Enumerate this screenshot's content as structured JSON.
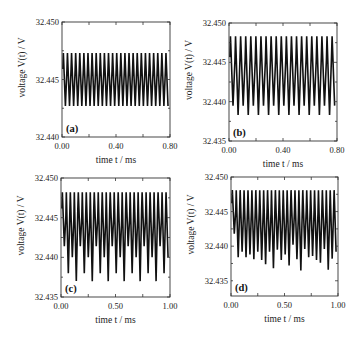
{
  "chart_data": [
    {
      "type": "line",
      "panel_label": "(a)",
      "title": "",
      "xlabel": "time t / ms",
      "ylabel": "voltage V(t) / V",
      "xlim": [
        0.0,
        0.8
      ],
      "ylim": [
        32.44,
        32.45
      ],
      "xticks": [
        "0.00",
        "0.40",
        "0.80"
      ],
      "yticks": [
        "32.440",
        "32.445",
        "32.450"
      ],
      "frame": {
        "left": 62,
        "top": 22,
        "right": 170,
        "bottom": 137
      },
      "grid": false,
      "series": [
        {
          "name": "V(t)",
          "description": "regular periodic oscillation, ~26 cycles",
          "cycles": 26,
          "max": 32.4473,
          "min_pattern": [
            32.4427
          ]
        }
      ]
    },
    {
      "type": "line",
      "panel_label": "(b)",
      "title": "",
      "xlabel": "time t / ms",
      "ylabel": "voltage V(t) / V",
      "xlim": [
        0.0,
        0.8
      ],
      "ylim": [
        32.435,
        32.45
      ],
      "xticks": [
        "0.00",
        "0.40",
        "0.80"
      ],
      "yticks": [
        "32.435",
        "32.440",
        "32.445",
        "32.450"
      ],
      "frame": {
        "left": 229,
        "top": 23,
        "right": 337,
        "bottom": 141
      },
      "grid": false,
      "series": [
        {
          "name": "V(t)",
          "description": "period-2 oscillation, alternating minima, ~21 cycles",
          "cycles": 21,
          "max": 32.4483,
          "min_pattern": [
            32.4395,
            32.4383
          ]
        }
      ]
    },
    {
      "type": "line",
      "panel_label": "(c)",
      "title": "",
      "xlabel": "time t / ms",
      "ylabel": "voltage V(t) / V",
      "xlim": [
        0.0,
        1.0
      ],
      "ylim": [
        32.435,
        32.45
      ],
      "xticks": [
        "0.00",
        "0.50",
        "1.00"
      ],
      "yticks": [
        "32.435",
        "32.440",
        "32.445",
        "32.450"
      ],
      "frame": {
        "left": 61,
        "top": 178,
        "right": 170,
        "bottom": 297
      },
      "grid": false,
      "series": [
        {
          "name": "V(t)",
          "description": "period-4 oscillation with repeating minima pattern, ~27 cycles",
          "cycles": 27,
          "max": 32.4482,
          "min_pattern": [
            32.4414,
            32.438,
            32.44,
            32.437
          ]
        }
      ]
    },
    {
      "type": "line",
      "panel_label": "(d)",
      "title": "",
      "xlabel": "time t / ms",
      "ylabel": "voltage V(t) / V",
      "xlim": [
        0.0,
        1.0
      ],
      "ylim": [
        32.4328,
        32.45
      ],
      "xticks": [
        "0.00",
        "0.50",
        "1.00"
      ],
      "yticks": [
        "32.435",
        "32.440",
        "32.445",
        "32.450"
      ],
      "frame": {
        "left": 231,
        "top": 177,
        "right": 338,
        "bottom": 296
      },
      "grid": false,
      "series": [
        {
          "name": "V(t)",
          "description": "irregular (chaotic-like) oscillation with varying minima, ~27 cycles",
          "cycles": 27,
          "max": 32.4481,
          "min_pattern": [
            32.4418,
            32.4384,
            32.4392,
            32.4384,
            32.4388,
            32.4381,
            32.4392,
            32.438,
            32.4374,
            32.4392,
            32.4368,
            32.4395,
            32.438,
            32.4388,
            32.4372,
            32.4402,
            32.4381,
            32.4365,
            32.4396,
            32.4384,
            32.4386,
            32.438,
            32.4376,
            32.4396,
            32.4366,
            32.4382,
            32.4392
          ]
        }
      ]
    }
  ]
}
